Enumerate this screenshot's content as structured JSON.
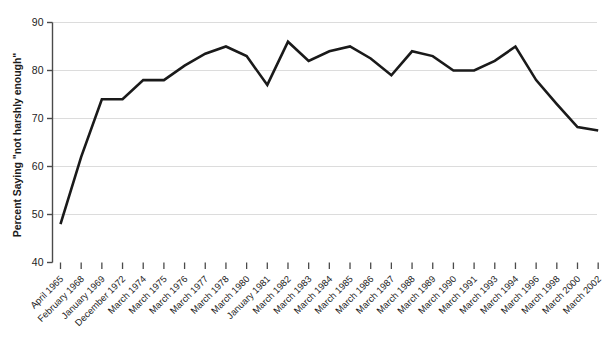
{
  "chart_data": {
    "type": "line",
    "title": "",
    "subtitle": "",
    "xlabel": "",
    "ylabel": "Percent Saying \"not harshly enough\"",
    "ylim": [
      40,
      90
    ],
    "yticks": [
      40,
      50,
      60,
      70,
      80,
      90
    ],
    "grid": "horizontal",
    "legend": "none",
    "line_color": "#1a1a1a",
    "grid_color": "#dcdcdc",
    "axis_color": "#4a4a4a",
    "background": "#ffffff",
    "categories": [
      "April 1965",
      "February 1968",
      "January 1969",
      "December 1972",
      "March 1974",
      "March 1975",
      "March 1976",
      "March 1977",
      "March 1978",
      "March 1980",
      "January 1981",
      "March 1982",
      "March 1983",
      "March 1984",
      "March 1985",
      "March 1986",
      "March 1987",
      "March 1988",
      "March 1989",
      "March 1990",
      "March 1991",
      "March 1993",
      "March 1994",
      "March 1996",
      "March 1998",
      "March 2000",
      "March 2002"
    ],
    "values": [
      48.0,
      62.0,
      74.0,
      74.0,
      78.0,
      78.0,
      81.0,
      83.5,
      85.0,
      83.0,
      77.0,
      86.0,
      82.0,
      84.0,
      85.0,
      82.5,
      79.0,
      84.0,
      83.0,
      80.0,
      80.0,
      82.0,
      85.0,
      78.0,
      73.0,
      68.2,
      67.5
    ],
    "series": [
      {
        "name": "Percent saying \"not harshly enough\"",
        "values": [
          48.0,
          62.0,
          74.0,
          74.0,
          78.0,
          78.0,
          81.0,
          83.5,
          85.0,
          83.0,
          77.0,
          86.0,
          82.0,
          84.0,
          85.0,
          82.5,
          79.0,
          84.0,
          83.0,
          80.0,
          80.0,
          82.0,
          85.0,
          78.0,
          73.0,
          68.2,
          67.5
        ]
      }
    ]
  }
}
